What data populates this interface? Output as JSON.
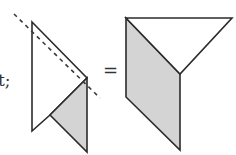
{
  "diagram": {
    "partial_text": "t;",
    "operator": "=",
    "colors": {
      "stroke": "#2b2b2b",
      "fill_white": "#ffffff",
      "fill_gray": "#d4d4d4",
      "dashed": "#3a3a3a"
    },
    "left_figure": {
      "description": "folded parallelogram strip with dashed fold line",
      "white_part": [
        [
          32,
          22
        ],
        [
          87,
          78
        ],
        [
          50,
          115
        ],
        [
          32,
          131
        ]
      ],
      "gray_part": [
        [
          87,
          78
        ],
        [
          87,
          152
        ],
        [
          50,
          115
        ]
      ],
      "fold_line": {
        "from": [
          14,
          14
        ],
        "to": [
          100,
          98
        ],
        "style": "dashed"
      }
    },
    "right_figure": {
      "description": "result of fold: white triangle on top of gray parallelogram",
      "white_triangle": [
        [
          126,
          18
        ],
        [
          232,
          18
        ],
        [
          180,
          74
        ]
      ],
      "gray_parallelogram": [
        [
          126,
          18
        ],
        [
          180,
          74
        ],
        [
          180,
          150
        ],
        [
          126,
          97
        ]
      ]
    }
  }
}
